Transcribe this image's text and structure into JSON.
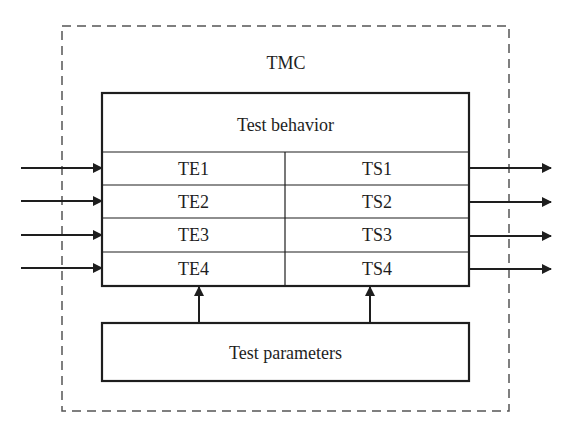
{
  "diagram": {
    "container": {
      "label": "TMC",
      "style": "dashed"
    },
    "behavior_box": {
      "title": "Test behavior",
      "rows": [
        {
          "left": "TE1",
          "right": "TS1"
        },
        {
          "left": "TE2",
          "right": "TS2"
        },
        {
          "left": "TE3",
          "right": "TS3"
        },
        {
          "left": "TE4",
          "right": "TS4"
        }
      ]
    },
    "parameters_box": {
      "label": "Test parameters"
    },
    "arrows": {
      "inputs": [
        "TE1",
        "TE2",
        "TE3",
        "TE4"
      ],
      "outputs": [
        "TS1",
        "TS2",
        "TS3",
        "TS4"
      ],
      "parameter_links": [
        "Test parameters -> TE column",
        "Test parameters -> TS column"
      ]
    },
    "colors": {
      "stroke": "#1e1e1e",
      "dashed": "#555555",
      "background": "#ffffff"
    }
  }
}
